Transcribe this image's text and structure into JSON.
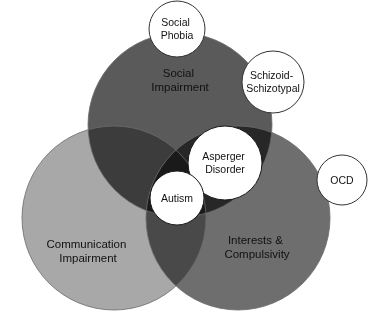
{
  "diagram": {
    "type": "venn",
    "title": "",
    "width": 374,
    "height": 324,
    "background": "#ffffff",
    "main_circles": [
      {
        "id": "social",
        "label_line1": "Social",
        "label_line2": "Impairment",
        "color": "#5a5a5a",
        "cx": 180,
        "cy": 125,
        "r": 92,
        "label_x": 180,
        "label_y": 77,
        "text_color": "#111111"
      },
      {
        "id": "communication",
        "label_line1": "Communication",
        "label_line2": "Impairment",
        "color": "#a8a8a8",
        "cx": 114,
        "cy": 218,
        "r": 92,
        "label_x": 88,
        "label_y": 248,
        "text_color": "#111111"
      },
      {
        "id": "interests",
        "label_line1": "Interests &",
        "label_line2": "Compulsivity",
        "color": "#6e6e6e",
        "cx": 238,
        "cy": 218,
        "r": 92,
        "label_x": 257,
        "label_y": 244,
        "text_color": "#111111"
      }
    ],
    "inset_circles": [
      {
        "id": "social-phobia",
        "label_line1": "Social",
        "label_line2": "Phobia",
        "cx": 177,
        "cy": 29,
        "r": 28,
        "fill": "#ffffff",
        "stroke": "#333333",
        "text_color": "#111111"
      },
      {
        "id": "schizoid-schizotypal",
        "label_line1": "Schizoid-",
        "label_line2": "Schizotypal",
        "cx": 273,
        "cy": 82,
        "r": 31,
        "fill": "#ffffff",
        "stroke": "#333333",
        "text_color": "#111111"
      },
      {
        "id": "ocd",
        "label_line1": "OCD",
        "label_line2": "",
        "cx": 342,
        "cy": 180,
        "r": 25,
        "fill": "#ffffff",
        "stroke": "#333333",
        "text_color": "#111111"
      },
      {
        "id": "asperger-disorder",
        "label_line1": "Asperger",
        "label_line2": "Disorder",
        "cx": 225,
        "cy": 163,
        "r": 37,
        "fill": "#ffffff",
        "stroke": "#1a1a1a",
        "text_color": "#111111"
      },
      {
        "id": "autism",
        "label_line1": "Autism",
        "label_line2": "",
        "cx": 177,
        "cy": 198,
        "r": 27,
        "fill": "#ffffff",
        "stroke": "#1a1a1a",
        "text_color": "#111111"
      }
    ],
    "overlap_colors": {
      "social_communication": "#2e2e2e",
      "social_interests": "#2a2a2a",
      "communication_interests": "#4a4a4a",
      "triple": "#101010"
    }
  }
}
